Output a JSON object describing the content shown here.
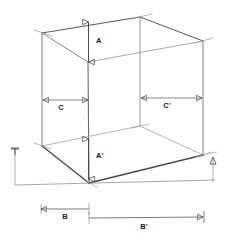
{
  "figure": {
    "type": "technical-line-drawing",
    "background_color": "#ffffff",
    "line_color_dark": "#3a3a3a",
    "line_color_mid": "#6e6e6e",
    "line_color_light": "#a8a8a8",
    "label_color": "#1a1a1a"
  },
  "labels": {
    "A": "A",
    "A_prime": "A'",
    "B": "B",
    "B_prime": "B'",
    "C": "C",
    "C_prime": "C'"
  },
  "dimensions": [
    {
      "id": "A",
      "label": "A",
      "orientation": "vertical",
      "label_x": 96,
      "label_y": 43,
      "x": 88.5,
      "y1": 22,
      "y2": 62,
      "arrow_start": true,
      "arrow_end": true
    },
    {
      "id": "A_prime",
      "label": "A'",
      "orientation": "vertical",
      "label_x": 97,
      "label_y": 158,
      "x": 88.5,
      "y1": 139,
      "y2": 179,
      "arrow_start": true,
      "arrow_end": true
    },
    {
      "id": "C",
      "label": "C",
      "orientation": "horizontal",
      "label_x": 61,
      "label_y": 110,
      "y": 100,
      "x1": 43,
      "x2": 88,
      "arrow_start": true,
      "arrow_end": true
    },
    {
      "id": "C_prime",
      "label": "C'",
      "orientation": "horizontal",
      "label_x": 167,
      "label_y": 108,
      "y": 98,
      "x1": 141,
      "x2": 202,
      "arrow_start": true,
      "arrow_end": true
    },
    {
      "id": "B",
      "label": "B",
      "orientation": "horizontal",
      "label_x": 65,
      "label_y": 219,
      "y": 209,
      "x1": 41,
      "x2": 89,
      "arrow_start": true,
      "arrow_end": false
    },
    {
      "id": "B_prime",
      "label": "B'",
      "orientation": "horizontal",
      "label_x": 144,
      "label_y": 229,
      "y": 218,
      "x1": 89,
      "x2": 203,
      "arrow_start": false,
      "arrow_end": true
    }
  ],
  "geometry": {
    "vertices": {
      "top_back_left": {
        "x": 42,
        "y": 33
      },
      "top_back_center": {
        "x": 140,
        "y": 17
      },
      "top_back_right": {
        "x": 203,
        "y": 41
      },
      "top_front_center": {
        "x": 88,
        "y": 62
      },
      "mid_left": {
        "x": 42,
        "y": 146
      },
      "mid_back_center": {
        "x": 140,
        "y": 126
      },
      "mid_right": {
        "x": 203,
        "y": 155
      },
      "bottom_front_center": {
        "x": 89,
        "y": 183
      }
    },
    "ground_line": {
      "x1": 15,
      "y": 185,
      "x2": 215,
      "y2": 180
    },
    "left_height_marker": {
      "x": 15,
      "y1": 148,
      "y2": 185
    },
    "right_height_marker": {
      "x": 213,
      "y1": 158,
      "y2": 182
    }
  }
}
